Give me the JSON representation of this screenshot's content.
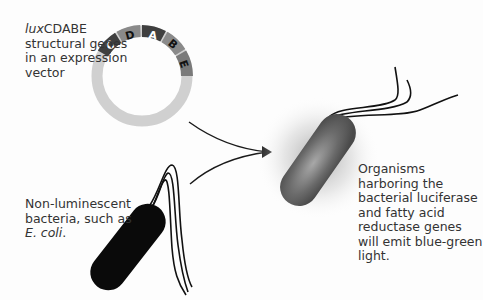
{
  "labels": {
    "vector": {
      "italic_prefix": "lux",
      "gene_name": "CDABE",
      "rest": "structural genes in an expression vector"
    },
    "non_luminescent": {
      "text": "Non-luminescent bacteria, such as ",
      "italic": "E. coli",
      "suffix": "."
    },
    "organisms": {
      "text": "Organisms harboring the bacterial luciferase and fatty acid reductase genes will emit blue-green light."
    }
  },
  "plasmid": {
    "segments": [
      {
        "letter": "C",
        "color": "#3f3f3f",
        "text_color": "#ffffff"
      },
      {
        "letter": "D",
        "color": "#8a8a8a",
        "text_color": "#111111"
      },
      {
        "letter": "A",
        "color": "#3f3f3f",
        "text_color": "#ffffff"
      },
      {
        "letter": "B",
        "color": "#8a8a8a",
        "text_color": "#111111"
      },
      {
        "letter": "E",
        "color": "#7a7a7a",
        "text_color": "#111111"
      }
    ],
    "backbone_color": "#d0d0d0"
  },
  "colors": {
    "dark_bacterium": "#0a0a0a",
    "glowing_bacterium": "#6e6e6e",
    "glow": "#bdbdbd",
    "arrow": "#1a1a1a",
    "flagella": "#111111"
  }
}
